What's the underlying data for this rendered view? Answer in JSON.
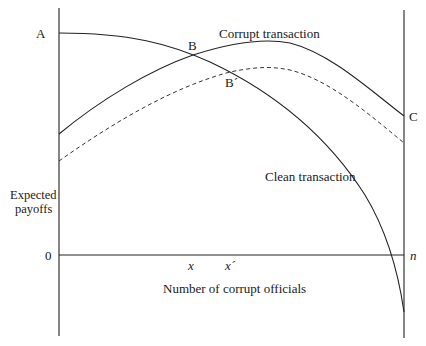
{
  "diagram": {
    "type": "payoff-curves",
    "y_axis_label_line1": "Expected",
    "y_axis_label_line2": "payoffs",
    "x_axis_label": "Number of corrupt officials",
    "zero_label": "0",
    "point_labels": {
      "A": "A",
      "B": "B",
      "B_prime": "B´",
      "C": "C"
    },
    "x_tick_labels": {
      "x": "x",
      "x_prime": "x´",
      "n": "n"
    },
    "curve_labels": {
      "corrupt": "Corrupt transaction",
      "clean": "Clean transaction"
    },
    "line_color": "#222222"
  }
}
